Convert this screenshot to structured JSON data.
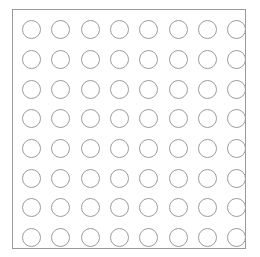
{
  "board": {
    "rows": 8,
    "columns": 8,
    "frame_color": "#9a9a9a",
    "circle_outline_color": "#9c9c9c",
    "background_color": "#ffffff",
    "cells": [
      [
        "empty",
        "empty",
        "empty",
        "empty",
        "empty",
        "empty",
        "empty",
        "empty"
      ],
      [
        "empty",
        "empty",
        "empty",
        "empty",
        "empty",
        "empty",
        "empty",
        "empty"
      ],
      [
        "empty",
        "empty",
        "empty",
        "empty",
        "empty",
        "empty",
        "empty",
        "empty"
      ],
      [
        "empty",
        "empty",
        "empty",
        "empty",
        "empty",
        "empty",
        "empty",
        "empty"
      ],
      [
        "empty",
        "empty",
        "empty",
        "empty",
        "empty",
        "empty",
        "empty",
        "empty"
      ],
      [
        "empty",
        "empty",
        "empty",
        "empty",
        "empty",
        "empty",
        "empty",
        "empty"
      ],
      [
        "empty",
        "empty",
        "empty",
        "empty",
        "empty",
        "empty",
        "empty",
        "empty"
      ],
      [
        "empty",
        "empty",
        "empty",
        "empty",
        "empty",
        "empty",
        "empty",
        "empty"
      ]
    ]
  }
}
